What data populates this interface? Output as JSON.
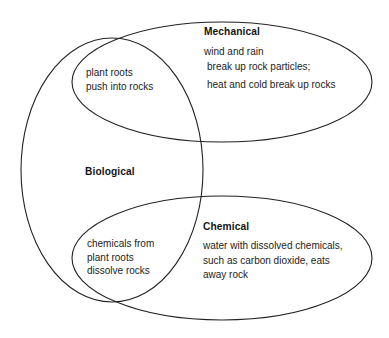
{
  "diagram": {
    "type": "venn",
    "background_color": "#ffffff",
    "stroke_color": "#222222",
    "sets": [
      {
        "name": "Biological",
        "label": "Biological",
        "shape": "ellipse",
        "items": []
      },
      {
        "name": "Mechanical",
        "label": "Mechanical",
        "shape": "ellipse",
        "items": [
          "wind and rain",
          "break up rock particles;",
          "heat and cold break up rocks"
        ]
      },
      {
        "name": "Chemical",
        "label": "Chemical",
        "shape": "ellipse",
        "items": [
          "water with dissolved chemicals,",
          "such as carbon dioxide, eats",
          "away rock"
        ]
      }
    ],
    "intersections": [
      {
        "name": "biological-mechanical",
        "between": [
          "Biological",
          "Mechanical"
        ],
        "items": [
          "plant roots",
          "push into rocks"
        ]
      },
      {
        "name": "biological-chemical",
        "between": [
          "Biological",
          "Chemical"
        ],
        "items": [
          "chemicals from",
          "plant roots",
          "dissolve rocks"
        ]
      }
    ]
  }
}
